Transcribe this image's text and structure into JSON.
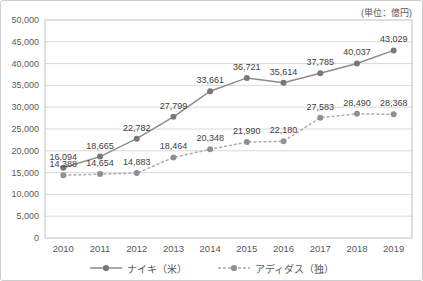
{
  "chart_data": {
    "type": "line",
    "title": "",
    "unit_label": "(単位：億円)",
    "categories": [
      "2010",
      "2011",
      "2012",
      "2013",
      "2014",
      "2015",
      "2016",
      "2017",
      "2018",
      "2019"
    ],
    "series": [
      {
        "name": "ナイキ（米）",
        "values": [
          16094,
          18665,
          22782,
          27799,
          33661,
          36721,
          35614,
          37785,
          40037,
          43029
        ],
        "line_color": "#8c8c8c",
        "marker_color": "#787878",
        "line_style": "solid"
      },
      {
        "name": "アディダス（独）",
        "values": [
          14388,
          14654,
          14883,
          18464,
          20348,
          21990,
          22180,
          27583,
          28490,
          28368
        ],
        "line_color": "#ababab",
        "marker_color": "#909090",
        "line_style": "dashed"
      }
    ],
    "ylim": [
      0,
      50000
    ],
    "ytick_step": 5000,
    "grid": "horizontal",
    "legend_position": "bottom",
    "data_labels": true,
    "colors": {
      "grid": "#d9d9d9",
      "plot_border": "#bfbfbf",
      "axis_text": "#595959",
      "label_text": "#404040",
      "frame_border": "#cdcdcd",
      "background": "#ffffff"
    }
  }
}
